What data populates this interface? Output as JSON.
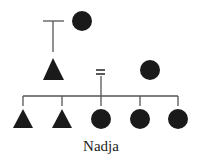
{
  "diagram": {
    "type": "kinship-chart",
    "colors": {
      "symbol": "#1a1a1a",
      "line": "#555555"
    },
    "generations": [
      {
        "level": 1,
        "members": [
          {
            "id": "g1-parent-line",
            "symbol": "descent-line-stub",
            "note": "line from unseen parents"
          },
          {
            "id": "g1-female",
            "symbol": "circle",
            "sex": "female"
          }
        ]
      },
      {
        "level": 2,
        "members": [
          {
            "id": "g2-male",
            "symbol": "triangle",
            "sex": "male"
          },
          {
            "id": "g2-marriage",
            "symbol": "equals",
            "meaning": "marriage"
          },
          {
            "id": "g2-female",
            "symbol": "circle",
            "sex": "female"
          }
        ]
      },
      {
        "level": 3,
        "members": [
          {
            "id": "g3-child-1",
            "symbol": "triangle",
            "sex": "male"
          },
          {
            "id": "g3-child-2",
            "symbol": "triangle",
            "sex": "male"
          },
          {
            "id": "g3-child-3",
            "symbol": "circle",
            "sex": "female",
            "label": "Nadja"
          },
          {
            "id": "g3-child-4",
            "symbol": "circle",
            "sex": "female"
          },
          {
            "id": "g3-child-5",
            "symbol": "circle",
            "sex": "female"
          }
        ]
      }
    ],
    "ego_label": "Nadja",
    "marriage_symbol": "="
  }
}
